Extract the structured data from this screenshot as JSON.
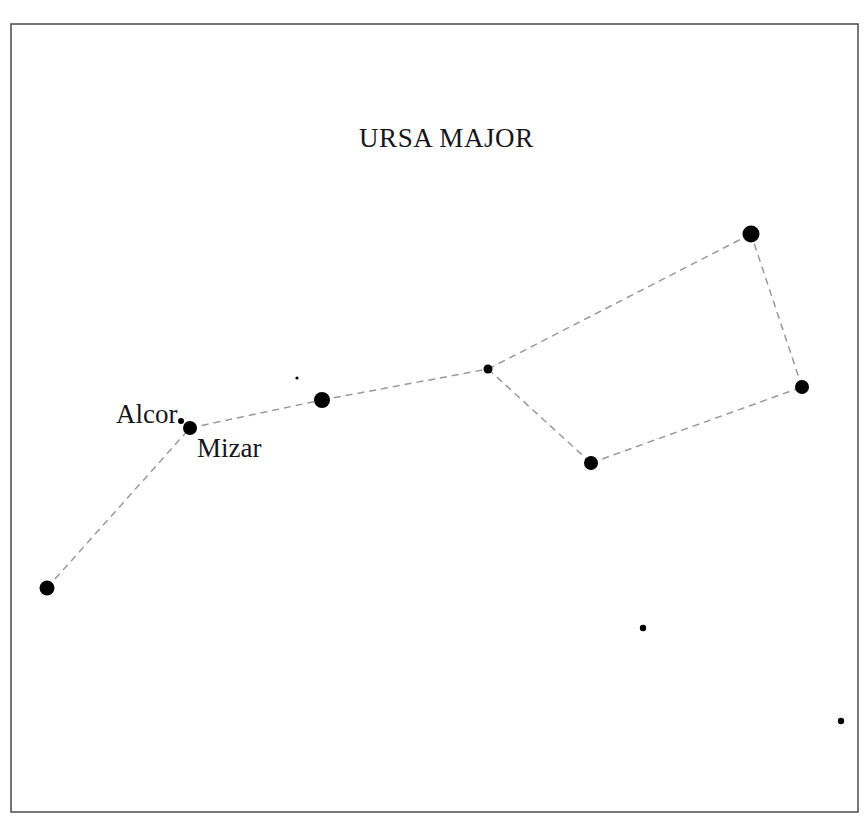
{
  "chart_data": {
    "type": "scatter",
    "title": "URSA MAJOR",
    "xlabel": "",
    "ylabel": "",
    "xlim": [
      0,
      867
    ],
    "ylim": [
      0,
      834
    ],
    "grid": false,
    "legend": "none",
    "background_color": "#ffffff",
    "star_color": "#000000",
    "line_color": "#9a9a9a",
    "frame_color": "#555555",
    "labels": [
      "Alcor",
      "Mizar"
    ],
    "stars": [
      {
        "id": "alkaid",
        "label": "",
        "x": 47,
        "y": 588,
        "r": 7.5,
        "kind": "bright"
      },
      {
        "id": "mizar",
        "label": "Mizar",
        "x": 190,
        "y": 428,
        "r": 7.0,
        "kind": "bright"
      },
      {
        "id": "alcor",
        "label": "Alcor",
        "x": 181,
        "y": 421,
        "r": 3.0,
        "kind": "faint"
      },
      {
        "id": "alioth",
        "label": "",
        "x": 322,
        "y": 400,
        "r": 8.0,
        "kind": "bright"
      },
      {
        "id": "megrez",
        "label": "",
        "x": 488,
        "y": 369,
        "r": 4.5,
        "kind": "medium"
      },
      {
        "id": "phecda",
        "label": "",
        "x": 591,
        "y": 463,
        "r": 7.0,
        "kind": "bright"
      },
      {
        "id": "dubhe",
        "label": "",
        "x": 751,
        "y": 234,
        "r": 8.5,
        "kind": "bright"
      },
      {
        "id": "merak",
        "label": "",
        "x": 802,
        "y": 387,
        "r": 7.0,
        "kind": "bright"
      },
      {
        "id": "field-star-1",
        "label": "",
        "x": 297,
        "y": 378,
        "r": 1.6,
        "kind": "field"
      },
      {
        "id": "field-star-2",
        "label": "",
        "x": 643,
        "y": 628,
        "r": 3.2,
        "kind": "field"
      },
      {
        "id": "field-star-3",
        "label": "",
        "x": 841,
        "y": 721,
        "r": 3.2,
        "kind": "field"
      }
    ],
    "connections": [
      {
        "from": "alkaid",
        "to": "mizar"
      },
      {
        "from": "mizar",
        "to": "alioth"
      },
      {
        "from": "alioth",
        "to": "megrez"
      },
      {
        "from": "megrez",
        "to": "dubhe"
      },
      {
        "from": "megrez",
        "to": "phecda"
      },
      {
        "from": "phecda",
        "to": "merak"
      },
      {
        "from": "merak",
        "to": "dubhe"
      }
    ],
    "frame": {
      "x": 11,
      "y": 24,
      "width": 847,
      "height": 788
    }
  }
}
